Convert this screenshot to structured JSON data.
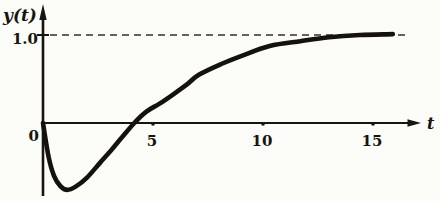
{
  "figure": {
    "background": "#fcfcf8",
    "ink": "#18140f",
    "labels": {
      "y_axis": "y(t)",
      "x_axis": "t",
      "y_tick_one": "1.0",
      "origin": "0"
    }
  },
  "chart_data": {
    "type": "line",
    "title": "",
    "xlabel": "t",
    "ylabel": "y(t)",
    "xlim": [
      0,
      17
    ],
    "ylim": [
      -0.9,
      1.35
    ],
    "x_ticks": [
      5,
      10,
      15
    ],
    "y_ticks": [
      1.0
    ],
    "y_tick_labels": [
      "1.0"
    ],
    "origin_label": "0",
    "grid": false,
    "legend_position": "none",
    "asymptote": {
      "y": 1.0,
      "style": "dashed"
    },
    "series": [
      {
        "name": "y(t)",
        "points": [
          [
            0,
            0
          ],
          [
            0.25,
            -0.38
          ],
          [
            0.5,
            -0.6
          ],
          [
            0.8,
            -0.72
          ],
          [
            1.1,
            -0.76
          ],
          [
            1.5,
            -0.72
          ],
          [
            2.0,
            -0.62
          ],
          [
            2.6,
            -0.45
          ],
          [
            3.1,
            -0.31
          ],
          [
            3.6,
            -0.16
          ],
          [
            4.15,
            0.0
          ],
          [
            4.7,
            0.13
          ],
          [
            5.3,
            0.22
          ],
          [
            6.0,
            0.34
          ],
          [
            6.5,
            0.43
          ],
          [
            7.1,
            0.55
          ],
          [
            8.1,
            0.67
          ],
          [
            9.0,
            0.76
          ],
          [
            10.3,
            0.875
          ],
          [
            11.7,
            0.93
          ],
          [
            13.0,
            0.975
          ],
          [
            14.4,
            1.0
          ],
          [
            15.9,
            1.01
          ]
        ]
      }
    ]
  }
}
